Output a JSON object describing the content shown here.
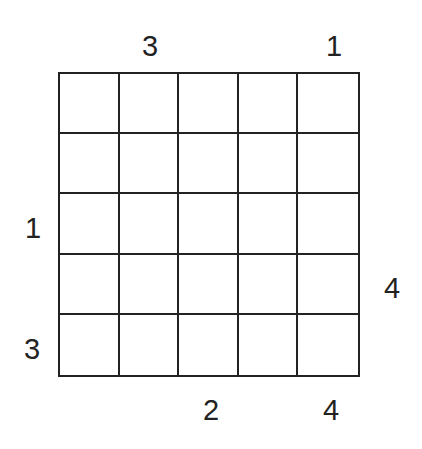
{
  "puzzle": {
    "type": "skyscraper",
    "size": 5,
    "cells": [
      [
        "",
        "",
        "",
        "",
        ""
      ],
      [
        "",
        "",
        "",
        "",
        ""
      ],
      [
        "",
        "",
        "",
        "",
        ""
      ],
      [
        "",
        "",
        "",
        "",
        ""
      ],
      [
        "",
        "",
        "",
        "",
        ""
      ]
    ],
    "clues": {
      "top": [
        "",
        "3",
        "",
        "",
        "1"
      ],
      "bottom": [
        "",
        "",
        "2",
        "",
        "4"
      ],
      "left": [
        "",
        "",
        "1",
        "",
        "3"
      ],
      "right": [
        "",
        "",
        "",
        "4",
        ""
      ]
    },
    "colors": {
      "line": "#222222",
      "text": "#222222",
      "background": "#ffffff"
    }
  }
}
